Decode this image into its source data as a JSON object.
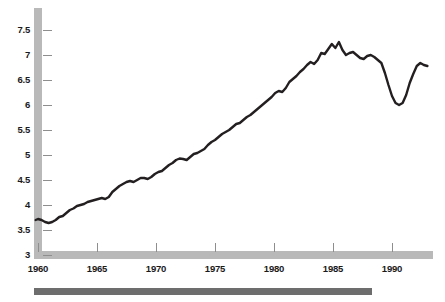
{
  "chart_data": {
    "type": "line",
    "title": "",
    "subtitle": "",
    "xlabel": "",
    "ylabel": "",
    "xlim": [
      1959.7,
      1993.2
    ],
    "ylim": [
      3,
      7.75
    ],
    "grid": false,
    "legend": null,
    "y_ticks": [
      3,
      3.5,
      4,
      4.5,
      5,
      5.5,
      6,
      6.5,
      7,
      7.5
    ],
    "y_tick_labels": [
      "3",
      "3.5",
      "4",
      "4.5",
      "5",
      "5.5",
      "6",
      "6.5",
      "7",
      "7.5"
    ],
    "x_ticks": [
      1960,
      1965,
      1970,
      1975,
      1980,
      1985,
      1990
    ],
    "x_tick_labels": [
      "1960",
      "1965",
      "1970",
      "1975",
      "1980",
      "1985",
      "1990"
    ],
    "series": [
      {
        "name": "series-1",
        "color": "#231f20",
        "x": [
          1959.8,
          1960.0,
          1960.3,
          1960.6,
          1960.9,
          1961.2,
          1961.5,
          1961.8,
          1962.1,
          1962.4,
          1962.7,
          1963.0,
          1963.3,
          1963.6,
          1963.9,
          1964.2,
          1964.5,
          1964.8,
          1965.1,
          1965.4,
          1965.7,
          1966.0,
          1966.3,
          1966.6,
          1966.9,
          1967.2,
          1967.5,
          1967.8,
          1968.1,
          1968.4,
          1968.7,
          1969.0,
          1969.3,
          1969.6,
          1969.9,
          1970.2,
          1970.5,
          1970.8,
          1971.1,
          1971.4,
          1971.7,
          1972.0,
          1972.3,
          1972.6,
          1972.9,
          1973.2,
          1973.5,
          1973.8,
          1974.1,
          1974.4,
          1974.7,
          1975.0,
          1975.3,
          1975.6,
          1975.9,
          1976.2,
          1976.5,
          1976.8,
          1977.1,
          1977.4,
          1977.7,
          1978.0,
          1978.3,
          1978.6,
          1978.9,
          1979.2,
          1979.5,
          1979.8,
          1980.1,
          1980.4,
          1980.7,
          1981.0,
          1981.3,
          1981.6,
          1981.9,
          1982.2,
          1982.5,
          1982.8,
          1983.1,
          1983.4,
          1983.7,
          1984.0,
          1984.3,
          1984.6,
          1984.9,
          1985.2,
          1985.5,
          1985.8,
          1986.1,
          1986.4,
          1986.7,
          1987.0,
          1987.3,
          1987.6,
          1987.9,
          1988.2,
          1988.5,
          1988.8,
          1989.1,
          1989.4,
          1989.7,
          1990.0,
          1990.3,
          1990.6,
          1990.9,
          1991.2,
          1991.5,
          1991.8,
          1992.1,
          1992.4,
          1992.7,
          1993.0
        ],
        "y": [
          3.7,
          3.72,
          3.7,
          3.66,
          3.64,
          3.66,
          3.7,
          3.76,
          3.78,
          3.84,
          3.9,
          3.93,
          3.98,
          4.0,
          4.02,
          4.06,
          4.08,
          4.1,
          4.12,
          4.14,
          4.12,
          4.16,
          4.26,
          4.32,
          4.38,
          4.42,
          4.46,
          4.48,
          4.46,
          4.5,
          4.54,
          4.54,
          4.52,
          4.56,
          4.62,
          4.66,
          4.68,
          4.74,
          4.8,
          4.84,
          4.9,
          4.93,
          4.92,
          4.9,
          4.96,
          5.02,
          5.04,
          5.08,
          5.12,
          5.2,
          5.26,
          5.3,
          5.36,
          5.42,
          5.46,
          5.5,
          5.56,
          5.62,
          5.64,
          5.7,
          5.76,
          5.8,
          5.86,
          5.92,
          5.98,
          6.04,
          6.1,
          6.16,
          6.24,
          6.28,
          6.26,
          6.34,
          6.46,
          6.52,
          6.58,
          6.66,
          6.72,
          6.8,
          6.86,
          6.82,
          6.9,
          7.04,
          7.02,
          7.12,
          7.22,
          7.14,
          7.26,
          7.1,
          7.0,
          7.04,
          7.06,
          7.0,
          6.94,
          6.92,
          6.98,
          7.0,
          6.96,
          6.9,
          6.84,
          6.64,
          6.4,
          6.18,
          6.04,
          6.0,
          6.04,
          6.2,
          6.44,
          6.62,
          6.78,
          6.84,
          6.8,
          6.78
        ]
      }
    ]
  },
  "axes": {
    "y_axis_name": "y-axis",
    "x_axis_name": "x-axis",
    "axis_color": "#b9b9b9",
    "tick_color": "#8e8e8e",
    "label_color": "#1a1a1a"
  },
  "decorations": {
    "footer_rule_color": "#6d6d6d"
  }
}
